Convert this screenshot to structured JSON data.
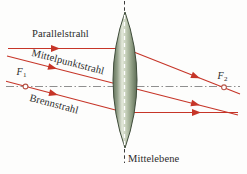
{
  "figure": {
    "type": "optics-converging-lens-ray-diagram",
    "labels": {
      "parallel_ray": "Parallelstrahl",
      "center_ray": "Mittelpunktstrahl",
      "focal_ray": "Brennstrahl",
      "center_plane": "Mittelebene"
    },
    "focal_points": {
      "f1": {
        "symbol": "F",
        "sub": "1"
      },
      "f2": {
        "symbol": "F",
        "sub": "2"
      }
    },
    "colors": {
      "ray": "#c63528",
      "axis": "#8f8f8f",
      "focal_marker": "#b75548",
      "text": "#2b2b2b",
      "lens_outline": "#3f4c3a",
      "center_line_dark": "#3a3a3a",
      "center_line_light": "#ffffff"
    }
  }
}
